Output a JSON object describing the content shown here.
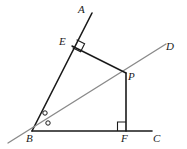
{
  "figure": {
    "type": "geometry-diagram",
    "background_color": "#ffffff",
    "stroke_colors": {
      "dark": "#1a1a1a",
      "gray": "#8a8a8a"
    },
    "labels": [
      {
        "id": "A",
        "text": "A",
        "x": 78,
        "y": 4
      },
      {
        "id": "E",
        "text": "E",
        "x": 59,
        "y": 36
      },
      {
        "id": "D",
        "text": "D",
        "x": 166,
        "y": 41
      },
      {
        "id": "P",
        "text": "P",
        "x": 128,
        "y": 71
      },
      {
        "id": "B",
        "text": "B",
        "x": 26,
        "y": 133
      },
      {
        "id": "F",
        "text": "F",
        "x": 121,
        "y": 133
      },
      {
        "id": "C",
        "text": "C",
        "x": 153,
        "y": 133
      }
    ],
    "points": {
      "A": {
        "x": 92,
        "y": 13
      },
      "E": {
        "x": 72,
        "y": 46
      },
      "B": {
        "x": 32,
        "y": 131
      },
      "P": {
        "x": 126,
        "y": 73
      },
      "D": {
        "x": 166,
        "y": 44
      },
      "F": {
        "x": 126,
        "y": 131
      },
      "C": {
        "x": 152,
        "y": 131
      }
    },
    "segments": [
      {
        "name": "ray-BA",
        "from": "B",
        "to": "A",
        "color": "dark",
        "width": 1.6
      },
      {
        "name": "ray-BD",
        "from": "B-extended",
        "to": "D",
        "color": "gray",
        "width": 1.4
      },
      {
        "name": "ray-BC",
        "from": "B",
        "to": "C",
        "color": "dark",
        "width": 1.6
      },
      {
        "name": "segment-EP",
        "from": "E",
        "to": "P",
        "color": "dark",
        "width": 1.4
      },
      {
        "name": "segment-PF",
        "from": "P",
        "to": "F",
        "color": "dark",
        "width": 1.6
      }
    ],
    "right_angle_marks": [
      {
        "name": "right-angle-at-E",
        "vertex": "E"
      },
      {
        "name": "right-angle-at-F",
        "vertex": "F"
      }
    ],
    "angle_marks": [
      {
        "name": "angle-mark-upper",
        "symbol": "circle",
        "x": 45,
        "y": 113,
        "r": 2.2
      },
      {
        "name": "angle-mark-lower",
        "symbol": "circle",
        "x": 48,
        "y": 123,
        "r": 2.2
      }
    ]
  }
}
